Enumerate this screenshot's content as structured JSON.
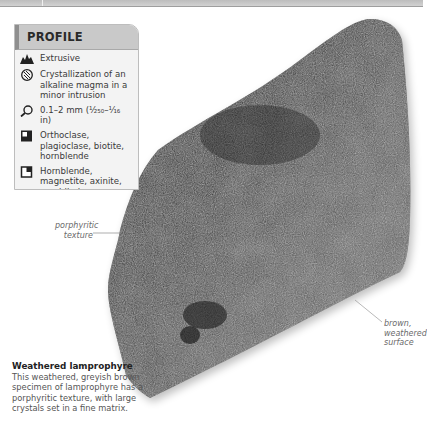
{
  "profile": {
    "title": "PROFILE",
    "items": [
      {
        "icon": "extrusive-mountain-icon",
        "text": "Extrusive"
      },
      {
        "icon": "crystal-formation-icon",
        "text": "Crystallization of an alkaline magma in a minor intrusion"
      },
      {
        "icon": "magnifier-grain-size-icon",
        "text": "0.1–2 mm (¹⁄₂₅₀–¹⁄₁₆ in)"
      },
      {
        "icon": "essential-minerals-icon",
        "text": "Orthoclase, plagioclase, biotite, hornblende"
      },
      {
        "icon": "accessory-minerals-icon",
        "text": "Hornblende, magnetite, axinite, amphibole, pyroxene"
      },
      {
        "icon": "color-wheel-icon",
        "text": "Dark brown to black"
      }
    ]
  },
  "annotations": {
    "porphyritic": "porphyritic texture",
    "weathered": "brown, weathered surface"
  },
  "caption": {
    "title": "Weathered lamprophyre",
    "body": "This weathered, greyish brown specimen of lamprophyre has a porphyritic texture, with large crystals set in a fine matrix."
  },
  "colors": {
    "header_bg": "#c9c9c9",
    "box_bg": "#f3f3f3",
    "rock_dark": "#1c1c1c",
    "rock_mid": "#5a5a5a"
  }
}
